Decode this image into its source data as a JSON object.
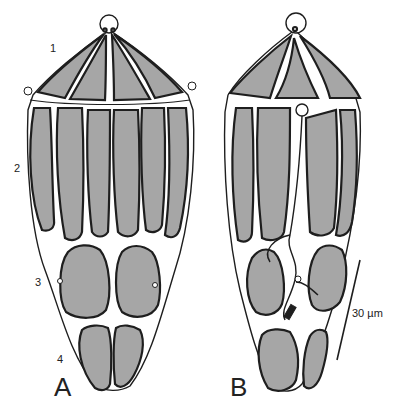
{
  "figure": {
    "panel_a": {
      "label": "A",
      "tier_labels": [
        "1",
        "2",
        "3",
        "4"
      ]
    },
    "panel_b": {
      "label": "B"
    },
    "scale_bar": {
      "label": "30 µm"
    },
    "colors": {
      "fill": "#a6a6a6",
      "outline": "#1e1e1e",
      "background": "#ffffff"
    }
  }
}
